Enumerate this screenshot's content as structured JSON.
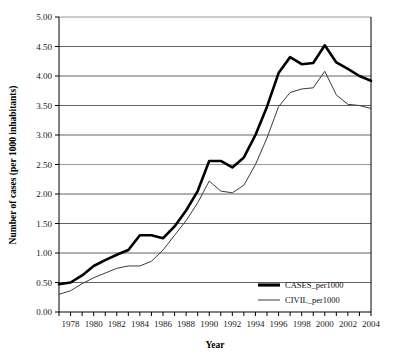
{
  "chart_data": {
    "type": "line",
    "title": "",
    "xlabel": "Year",
    "ylabel": "Number of cases (per 1000 inhabitants)",
    "xlim": [
      1977,
      2004
    ],
    "ylim": [
      0.0,
      5.0
    ],
    "ytick_step": 0.5,
    "grid": true,
    "grid_axis": "y",
    "legend_position": "bottom-right-inside",
    "x": [
      1977,
      1978,
      1979,
      1980,
      1981,
      1982,
      1983,
      1984,
      1985,
      1986,
      1987,
      1988,
      1989,
      1990,
      1991,
      1992,
      1993,
      1994,
      1995,
      1996,
      1997,
      1998,
      1999,
      2000,
      2001,
      2002,
      2003,
      2004
    ],
    "xtick_labels": [
      "",
      "1978",
      "",
      "1980",
      "",
      "1982",
      "",
      "1984",
      "",
      "1986",
      "",
      "1988",
      "",
      "1990",
      "",
      "1992",
      "",
      "1994",
      "",
      "1996",
      "",
      "1998",
      "",
      "2000",
      "",
      "2002",
      "",
      "2004"
    ],
    "ytick_labels": [
      "0.00",
      "0.50",
      "1.00",
      "1.50",
      "2.00",
      "2.50",
      "3.00",
      "3.50",
      "4.00",
      "4.50",
      "5.00"
    ],
    "series": [
      {
        "name": "CASES_per1000",
        "color": "#000000",
        "width": 2.6,
        "values": [
          0.47,
          0.5,
          0.62,
          0.78,
          0.88,
          0.97,
          1.05,
          1.3,
          1.3,
          1.25,
          1.45,
          1.72,
          2.05,
          2.56,
          2.56,
          2.45,
          2.62,
          3.0,
          3.48,
          4.05,
          4.32,
          4.2,
          4.22,
          4.52,
          4.23,
          4.12,
          4.0,
          3.92
        ]
      },
      {
        "name": "CIVIL_per1000",
        "color": "#3a3a3a",
        "width": 1.0,
        "values": [
          0.3,
          0.36,
          0.48,
          0.58,
          0.66,
          0.74,
          0.78,
          0.78,
          0.86,
          1.05,
          1.3,
          1.55,
          1.85,
          2.22,
          2.05,
          2.02,
          2.15,
          2.5,
          2.95,
          3.48,
          3.72,
          3.78,
          3.8,
          4.08,
          3.68,
          3.52,
          3.5,
          3.45
        ]
      }
    ]
  },
  "axes": {
    "y_axis_title": "Number of cases (per 1000 inhabitants)",
    "x_axis_title": "Year"
  },
  "legend": {
    "entries": [
      {
        "label": "CASES_per1000"
      },
      {
        "label": "CIVIL_per1000"
      }
    ]
  }
}
